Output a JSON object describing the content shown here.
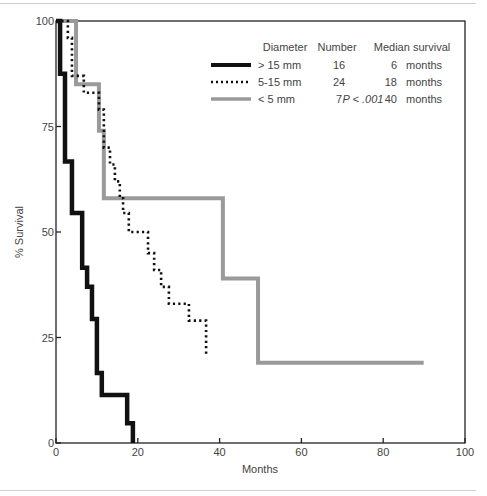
{
  "chart_data": {
    "type": "line",
    "subtype": "kaplan-meier-step",
    "title": "",
    "xlabel": "Months",
    "ylabel": "% Survival",
    "xlim": [
      0,
      100
    ],
    "ylim": [
      0,
      100
    ],
    "xticks": [
      0,
      20,
      40,
      60,
      80,
      100
    ],
    "yticks": [
      0,
      25,
      50,
      75,
      100
    ],
    "grid": false,
    "legend_position": "upper right (inside)",
    "legend_headers": [
      "Diameter",
      "Number",
      "Median survival"
    ],
    "annotation": "P < .001",
    "series": [
      {
        "name": "> 15 mm",
        "number": "16",
        "median_survival": "6",
        "median_unit": "months",
        "style": "solid-thick",
        "color": "#111111",
        "steps": [
          [
            0,
            100
          ],
          [
            1.0,
            87.5
          ],
          [
            2.2,
            66.7
          ],
          [
            3.9,
            54.5
          ],
          [
            6.4,
            41.5
          ],
          [
            7.6,
            37
          ],
          [
            8.8,
            29.4
          ],
          [
            10.0,
            16.6
          ],
          [
            11.2,
            11.4
          ],
          [
            17.4,
            4.7
          ],
          [
            18.8,
            0
          ]
        ],
        "end_x": 18.8
      },
      {
        "name": "5-15 mm",
        "number": "24",
        "median_survival": "18",
        "median_unit": "months",
        "style": "dotted",
        "color": "#111111",
        "steps": [
          [
            0,
            100
          ],
          [
            2.9,
            96
          ],
          [
            3.9,
            87
          ],
          [
            6.8,
            83
          ],
          [
            10.5,
            79
          ],
          [
            11.7,
            70
          ],
          [
            13.2,
            66
          ],
          [
            14.4,
            62
          ],
          [
            15.6,
            58
          ],
          [
            16.4,
            54.5
          ],
          [
            17.8,
            50
          ],
          [
            22.5,
            45
          ],
          [
            24.0,
            41
          ],
          [
            25.7,
            37
          ],
          [
            27.6,
            33
          ],
          [
            32.5,
            29
          ]
        ],
        "end_x": 36.7,
        "end_y": 21
      },
      {
        "name": "< 5 mm",
        "number": "7",
        "median_survival": "40",
        "median_unit": "months",
        "style": "solid-gray",
        "color": "#9a9a9a",
        "steps": [
          [
            0,
            100
          ],
          [
            4.9,
            85
          ],
          [
            10.5,
            74
          ],
          [
            11.7,
            58
          ],
          [
            40.8,
            39
          ],
          [
            49.4,
            19
          ]
        ],
        "end_x": 89.9
      }
    ]
  }
}
